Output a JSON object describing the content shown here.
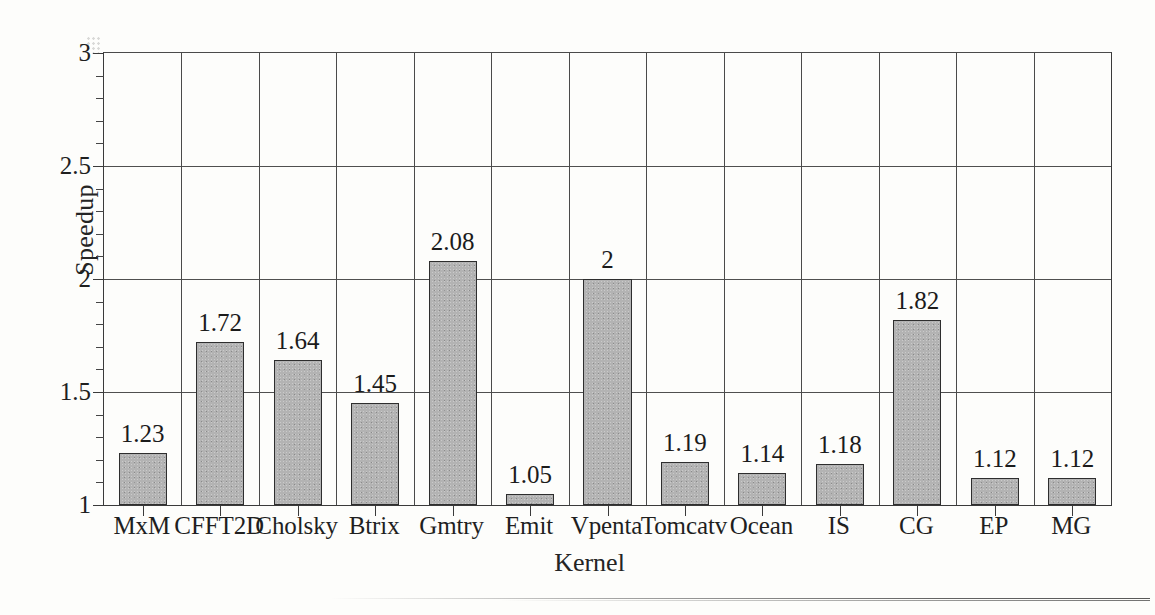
{
  "chart_data": {
    "type": "bar",
    "title": "",
    "subtitle": "",
    "xlabel": "Kernel",
    "ylabel": "Speedup",
    "categories": [
      "MxM",
      "CFFT2D",
      "Cholsky",
      "Btrix",
      "Gmtry",
      "Emit",
      "Vpenta",
      "Tomcatv",
      "Ocean",
      "IS",
      "CG",
      "EP",
      "MG"
    ],
    "values": [
      1.23,
      1.72,
      1.64,
      1.45,
      2.08,
      1.05,
      2,
      1.19,
      1.14,
      1.18,
      1.82,
      1.12,
      1.12
    ],
    "data_labels": [
      "1.23",
      "1.72",
      "1.64",
      "1.45",
      "2.08",
      "1.05",
      "2",
      "1.19",
      "1.14",
      "1.18",
      "1.82",
      "1.12",
      "1.12"
    ],
    "ylim": [
      1,
      3
    ],
    "ymajor_ticks": [
      1,
      1.5,
      2,
      2.5,
      3
    ],
    "ymajor_tick_labels": [
      "1",
      "1.5",
      "2",
      "2.5",
      "3"
    ],
    "yminor_tick_step": 0.1,
    "grid": {
      "horizontal": true,
      "vertical": true,
      "note": "vertical gridlines separate each category cell"
    },
    "legend": {
      "visible": false,
      "position": "none"
    },
    "bar_fill_color": "#b3b3b3",
    "bar_edge_color": "#2e2e2e",
    "axis_color": "#3a3a3a",
    "background_color": "#fdfdfb",
    "text_color": "#1f1f1f"
  }
}
